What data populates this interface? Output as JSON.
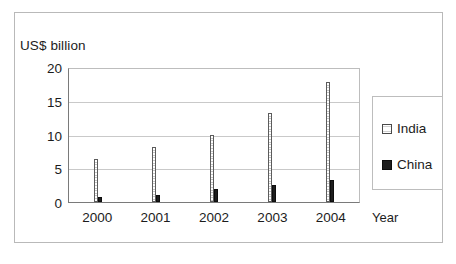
{
  "chart_data": {
    "type": "bar",
    "title": "",
    "subtitle": "",
    "xlabel": "Year",
    "ylabel": "US$ billion",
    "categories": [
      "2000",
      "2001",
      "2002",
      "2003",
      "2004"
    ],
    "series": [
      {
        "name": "India",
        "values": [
          6.5,
          8.2,
          10.1,
          13.4,
          18.0
        ],
        "color": "#f2f2f2",
        "pattern": "horizontal-hatch",
        "border_color": "#5c5c5c"
      },
      {
        "name": "China",
        "values": [
          0.7,
          1.0,
          2.0,
          2.5,
          3.3
        ],
        "color": "#1d1d1d",
        "pattern": "solid",
        "border_color": "#0d0d0d"
      }
    ],
    "ylim": [
      0,
      20
    ],
    "yticks": [
      0,
      5,
      10,
      15,
      20
    ],
    "ytick_labels": [
      "0",
      "5",
      "10",
      "15",
      "20"
    ],
    "grid": true,
    "grid_axis": "y",
    "legend_position": "right",
    "legend_entries": [
      "India",
      "China"
    ],
    "annotations": []
  },
  "figure": {
    "frame_color": "#b9b9b9",
    "background": "#ffffff",
    "axis_color": "#7a7a7a",
    "gridline_color": "#c9c9c9",
    "text_color": "#1c1c1c"
  }
}
